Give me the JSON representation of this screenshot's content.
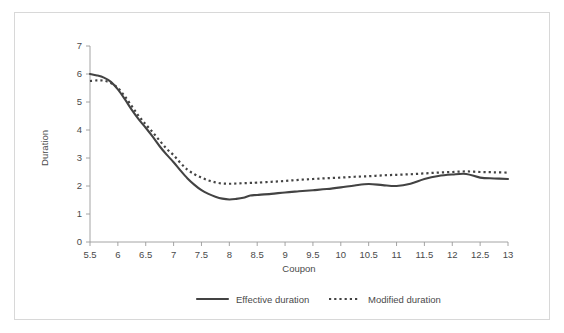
{
  "figure": {
    "background_color": "#ffffff",
    "frame_color": "#d8d8d8",
    "axis_color": "#9a9a9a",
    "text_color": "#4a4a4a"
  },
  "chart_data": {
    "type": "line",
    "title": "",
    "xlabel": "Coupon",
    "ylabel": "Duration",
    "xlim": [
      5.5,
      13
    ],
    "ylim": [
      0,
      7
    ],
    "grid": false,
    "legend_position": "bottom",
    "x_ticks": [
      "5.5",
      "6",
      "6.5",
      "7",
      "7.5",
      "8",
      "8.5",
      "9",
      "9.5",
      "10",
      "10.5",
      "11",
      "11.5",
      "12",
      "12.5",
      "13"
    ],
    "y_ticks": [
      "0",
      "1",
      "2",
      "3",
      "4",
      "5",
      "6",
      "7"
    ],
    "x": [
      5.5,
      5.625,
      5.75,
      5.875,
      6.0,
      6.125,
      6.25,
      6.375,
      6.5,
      6.625,
      6.75,
      6.875,
      7.0,
      7.125,
      7.25,
      7.375,
      7.5,
      7.625,
      7.75,
      7.875,
      8.0,
      8.125,
      8.25,
      8.375,
      8.5,
      8.75,
      9.0,
      9.25,
      9.5,
      9.75,
      10.0,
      10.25,
      10.5,
      10.75,
      11.0,
      11.25,
      11.5,
      11.75,
      12.0,
      12.25,
      12.5,
      12.75,
      13.0
    ],
    "series": [
      {
        "name": "Effective duration",
        "style": "solid",
        "color": "#434343",
        "values": [
          6.0,
          5.95,
          5.87,
          5.72,
          5.45,
          5.1,
          4.72,
          4.38,
          4.08,
          3.76,
          3.42,
          3.12,
          2.85,
          2.55,
          2.27,
          2.04,
          1.85,
          1.72,
          1.62,
          1.55,
          1.52,
          1.54,
          1.58,
          1.66,
          1.68,
          1.72,
          1.77,
          1.81,
          1.85,
          1.89,
          1.95,
          2.02,
          2.07,
          2.03,
          2.0,
          2.08,
          2.25,
          2.36,
          2.41,
          2.43,
          2.3,
          2.27,
          2.25
        ]
      },
      {
        "name": "Modified duration",
        "style": "dotted",
        "color": "#434343",
        "values": [
          5.75,
          5.77,
          5.76,
          5.68,
          5.5,
          5.2,
          4.85,
          4.5,
          4.2,
          3.92,
          3.62,
          3.33,
          3.1,
          2.82,
          2.58,
          2.42,
          2.3,
          2.2,
          2.13,
          2.09,
          2.08,
          2.09,
          2.1,
          2.11,
          2.12,
          2.15,
          2.18,
          2.22,
          2.25,
          2.28,
          2.3,
          2.33,
          2.35,
          2.38,
          2.4,
          2.42,
          2.45,
          2.48,
          2.5,
          2.52,
          2.5,
          2.49,
          2.48
        ]
      }
    ]
  },
  "legend": {
    "items": [
      {
        "label": "Effective duration",
        "style": "solid"
      },
      {
        "label": "Modified duration",
        "style": "dotted"
      }
    ]
  }
}
